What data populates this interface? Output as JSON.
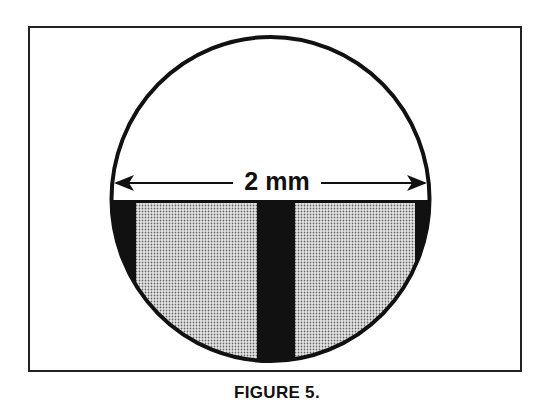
{
  "figure": {
    "measurement_label": "2 mm",
    "caption": "FIGURE 5."
  },
  "diagram": {
    "type": "cross-section circle",
    "elements": [
      {
        "name": "circle-outline",
        "description": "circular view field"
      },
      {
        "name": "dimension-arrow",
        "label": "2 mm",
        "description": "double-headed arrow spanning circle diameter"
      },
      {
        "name": "dark-band",
        "description": "black regions at sides and center bar in lower half"
      },
      {
        "name": "stippled-region-left",
        "description": "dotted grey fill, left of center bar"
      },
      {
        "name": "stippled-region-right",
        "description": "dotted grey fill, right of center bar"
      }
    ],
    "colors": {
      "stroke": "#111111",
      "dark": "#111111",
      "stipple": "#777777",
      "background": "#ffffff"
    }
  }
}
